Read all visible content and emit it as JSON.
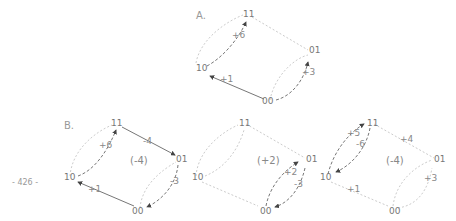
{
  "page_number": "- 426 -",
  "panels": {
    "A": {
      "label": "A."
    },
    "B": {
      "label": "B."
    }
  },
  "diagram_A": {
    "nodes": {
      "n11": "11",
      "n01": "01",
      "n10": "10",
      "n00": "00"
    },
    "edges": {
      "e_10_11": "+6",
      "e_00_10": "+1",
      "e_00_01": "+3"
    }
  },
  "diagram_B1": {
    "nodes": {
      "n11": "11",
      "n01": "01",
      "n10": "10",
      "n00": "00"
    },
    "center": "(-4)",
    "edges": {
      "e_10_11": "+6",
      "e_11_01": "-4",
      "e_00_10": "+1",
      "e_01_00": "-3"
    }
  },
  "diagram_B2": {
    "nodes": {
      "n11": "11",
      "n01": "01",
      "n10": "10",
      "n00": "00"
    },
    "center": "(+2)",
    "edges": {
      "e_00_01": "+2",
      "e_01_00": "-3"
    }
  },
  "diagram_B3": {
    "nodes": {
      "n11": "11",
      "n01": "01",
      "n10": "10",
      "n00": "00"
    },
    "center": "(-4)",
    "edges": {
      "e_10_11": "+5",
      "e_11_10": "-6",
      "e_11_01": "+4",
      "e_00_10": "+1",
      "e_00_01": "+3"
    }
  }
}
